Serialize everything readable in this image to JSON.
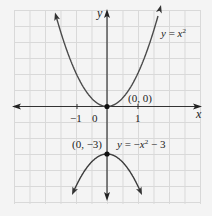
{
  "figure": {
    "axes": {
      "x_label": "x",
      "y_label": "y",
      "ticks": [
        {
          "value": -1,
          "label": "−1"
        },
        {
          "value": 0,
          "label": "0"
        },
        {
          "value": 1,
          "label": "1"
        }
      ]
    },
    "curves": [
      {
        "name": "upper-parabola",
        "equation_label": "y = x²",
        "vertex": "(0, 0)",
        "opens": "up"
      },
      {
        "name": "lower-parabola",
        "equation_label": "y = −x² − 3",
        "vertex": "(0, −3)",
        "opens": "down"
      }
    ],
    "points": [
      {
        "label": "(0, 0)"
      },
      {
        "label": "(0, −3)"
      }
    ],
    "colors": {
      "background": "#f4f4f4",
      "grid": "#d6d6d6",
      "axis": "#333333",
      "curve": "#4a4a4a",
      "point": "#111111"
    }
  },
  "chart_data": {
    "type": "line",
    "title": "",
    "xlabel": "x",
    "ylabel": "y",
    "x_ticks": [
      -1,
      0,
      1
    ],
    "grid": true,
    "series": [
      {
        "name": "y = x^2",
        "x": [
          -1.7,
          -1,
          0,
          1,
          1.7
        ],
        "y": [
          2.9,
          1,
          0,
          1,
          2.9
        ]
      },
      {
        "name": "y = -x^2 - 3",
        "x": [
          -1.2,
          -1,
          0,
          1,
          1.2
        ],
        "y": [
          -4.4,
          -4,
          -3,
          -4,
          -4.4
        ]
      }
    ],
    "annotations": [
      "(0, 0)",
      "(0, -3)",
      "y = x^2",
      "y = -x^2 - 3"
    ]
  }
}
